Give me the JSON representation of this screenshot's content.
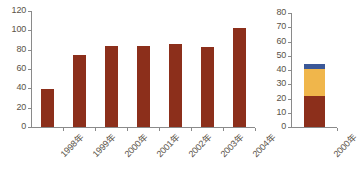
{
  "figure": {
    "background_color": "#ffffff",
    "axis_color": "#8a8a8a",
    "label_color": "#5a5248"
  },
  "colors": {
    "brown": "#8C2F1B",
    "amber": "#F0B64B",
    "blue": "#3B5898"
  },
  "chart_data": [
    {
      "id": "left-chart",
      "type": "bar",
      "title": "",
      "xlabel": "",
      "ylabel": "",
      "categories": [
        "1998年",
        "1999年",
        "2000年",
        "2001年",
        "2002年",
        "2003年",
        "2004年"
      ],
      "values": [
        39,
        74,
        84,
        84,
        86,
        83,
        102
      ],
      "series": [
        {
          "name": "系列 1",
          "color": "#8C2F1B",
          "values": [
            39,
            74,
            84,
            84,
            86,
            83,
            102
          ]
        }
      ],
      "ylim": [
        0,
        120
      ],
      "yticks": [
        0,
        20,
        40,
        60,
        80,
        100,
        120
      ],
      "ytick_labels": [
        "0",
        "20",
        "40",
        "60",
        "80",
        "100",
        "120"
      ],
      "grid": false,
      "legend": "none"
    },
    {
      "id": "right-chart",
      "type": "bar",
      "stacked": true,
      "title": "",
      "xlabel": "",
      "ylabel": "",
      "categories": [
        "2000年"
      ],
      "ylim": [
        0,
        80
      ],
      "yticks": [
        0,
        10,
        20,
        30,
        40,
        50,
        60,
        70,
        80
      ],
      "ytick_labels": [
        "0",
        "10",
        "20",
        "30",
        "40",
        "50",
        "60",
        "70",
        "80"
      ],
      "grid": false,
      "legend": "none",
      "series": [
        {
          "name": "系列 1",
          "color": "#8C2F1B",
          "values": [
            22
          ]
        },
        {
          "name": "系列 2",
          "color": "#F0B64B",
          "values": [
            19
          ]
        },
        {
          "name": "系列 3",
          "color": "#3B5898",
          "values": [
            3
          ]
        }
      ],
      "total": 44
    }
  ]
}
